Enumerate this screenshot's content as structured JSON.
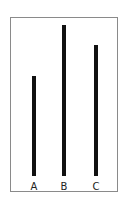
{
  "chart_data": {
    "type": "bar",
    "title": "",
    "xlabel": "",
    "ylabel": "",
    "categories": [
      "A",
      "B",
      "C"
    ],
    "values": [
      100,
      151,
      131
    ],
    "units": "relative line length (px)",
    "grid": false,
    "legend": null,
    "bar_color": "#111111",
    "frame_color": "#8a8a8a"
  },
  "labels": {
    "a": "A",
    "b": "B",
    "c": "C"
  }
}
